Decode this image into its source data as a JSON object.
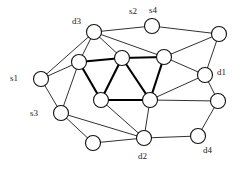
{
  "figure": {
    "type": "node-link-graph",
    "width": 240,
    "height": 169,
    "background_color": "#ffffff",
    "edge_color": "#1a1a1a",
    "node_fill_color": "#ffffff",
    "node_stroke_color": "#111111",
    "label_color": "#1a1a1a"
  },
  "labels": [
    {
      "id": "s1",
      "text": "s1",
      "x": 10,
      "y": 74
    },
    {
      "id": "s2",
      "text": "s2",
      "x": 129,
      "y": 7
    },
    {
      "id": "s3",
      "text": "s3",
      "x": 30,
      "y": 109
    },
    {
      "id": "s4",
      "text": "s4",
      "x": 149,
      "y": 6
    },
    {
      "id": "d1",
      "text": "d1",
      "x": 217,
      "y": 68
    },
    {
      "id": "d2",
      "text": "d2",
      "x": 138,
      "y": 152
    },
    {
      "id": "d3",
      "text": "d3",
      "x": 72,
      "y": 17
    },
    {
      "id": "d4",
      "text": "d4",
      "x": 203,
      "y": 146
    }
  ],
  "nodes": [
    {
      "id": "n1",
      "name": "node-d3",
      "x": 94,
      "y": 32,
      "r": 7.5
    },
    {
      "id": "n2",
      "name": "node-s4",
      "x": 152,
      "y": 26,
      "r": 7.5
    },
    {
      "id": "n3",
      "name": "node-top-right",
      "x": 219,
      "y": 34,
      "r": 7.5
    },
    {
      "id": "n4",
      "name": "node-upper-mid-left",
      "x": 79,
      "y": 62,
      "r": 7.5
    },
    {
      "id": "n5",
      "name": "node-center-top-left",
      "x": 122,
      "y": 58,
      "r": 7.5
    },
    {
      "id": "n6",
      "name": "node-center-top-right",
      "x": 164,
      "y": 57,
      "r": 7.5
    },
    {
      "id": "n7",
      "name": "node-s1",
      "x": 41,
      "y": 79,
      "r": 7.5
    },
    {
      "id": "n8",
      "name": "node-d1",
      "x": 205,
      "y": 75,
      "r": 7.5
    },
    {
      "id": "n9",
      "name": "node-center-bottom-left",
      "x": 101,
      "y": 100,
      "r": 7.5
    },
    {
      "id": "n10",
      "name": "node-center-bottom-right",
      "x": 150,
      "y": 100,
      "r": 7.5
    },
    {
      "id": "n11",
      "name": "node-right-lower",
      "x": 218,
      "y": 101,
      "r": 7.5
    },
    {
      "id": "n12",
      "name": "node-s3",
      "x": 61,
      "y": 113,
      "r": 7.5
    },
    {
      "id": "n13",
      "name": "node-bottom-left",
      "x": 93,
      "y": 143,
      "r": 7.5
    },
    {
      "id": "n14",
      "name": "node-d2",
      "x": 144,
      "y": 138,
      "r": 7.5
    },
    {
      "id": "n15",
      "name": "node-d4",
      "x": 198,
      "y": 136,
      "r": 7.5
    }
  ],
  "edges": [
    {
      "from": "n1",
      "to": "n2",
      "style": "normal"
    },
    {
      "from": "n2",
      "to": "n3",
      "style": "normal"
    },
    {
      "from": "n1",
      "to": "n4",
      "style": "normal"
    },
    {
      "from": "n1",
      "to": "n5",
      "style": "normal"
    },
    {
      "from": "n1",
      "to": "n6",
      "style": "normal"
    },
    {
      "from": "n1",
      "to": "n7",
      "style": "normal"
    },
    {
      "from": "n3",
      "to": "n6",
      "style": "normal"
    },
    {
      "from": "n3",
      "to": "n8",
      "style": "normal"
    },
    {
      "from": "n4",
      "to": "n5",
      "style": "bold"
    },
    {
      "from": "n5",
      "to": "n6",
      "style": "bold"
    },
    {
      "from": "n4",
      "to": "n7",
      "style": "normal"
    },
    {
      "from": "n4",
      "to": "n9",
      "style": "bold"
    },
    {
      "from": "n4",
      "to": "n12",
      "style": "normal"
    },
    {
      "from": "n5",
      "to": "n9",
      "style": "bold"
    },
    {
      "from": "n5",
      "to": "n10",
      "style": "bold"
    },
    {
      "from": "n6",
      "to": "n8",
      "style": "normal"
    },
    {
      "from": "n6",
      "to": "n10",
      "style": "bold"
    },
    {
      "from": "n7",
      "to": "n12",
      "style": "normal"
    },
    {
      "from": "n8",
      "to": "n10",
      "style": "normal"
    },
    {
      "from": "n8",
      "to": "n11",
      "style": "normal"
    },
    {
      "from": "n9",
      "to": "n10",
      "style": "bold"
    },
    {
      "from": "n9",
      "to": "n14",
      "style": "normal"
    },
    {
      "from": "n10",
      "to": "n11",
      "style": "normal"
    },
    {
      "from": "n10",
      "to": "n14",
      "style": "normal"
    },
    {
      "from": "n11",
      "to": "n15",
      "style": "normal"
    },
    {
      "from": "n12",
      "to": "n13",
      "style": "normal"
    },
    {
      "from": "n12",
      "to": "n14",
      "style": "normal"
    },
    {
      "from": "n13",
      "to": "n14",
      "style": "normal"
    },
    {
      "from": "n14",
      "to": "n15",
      "style": "normal"
    }
  ]
}
